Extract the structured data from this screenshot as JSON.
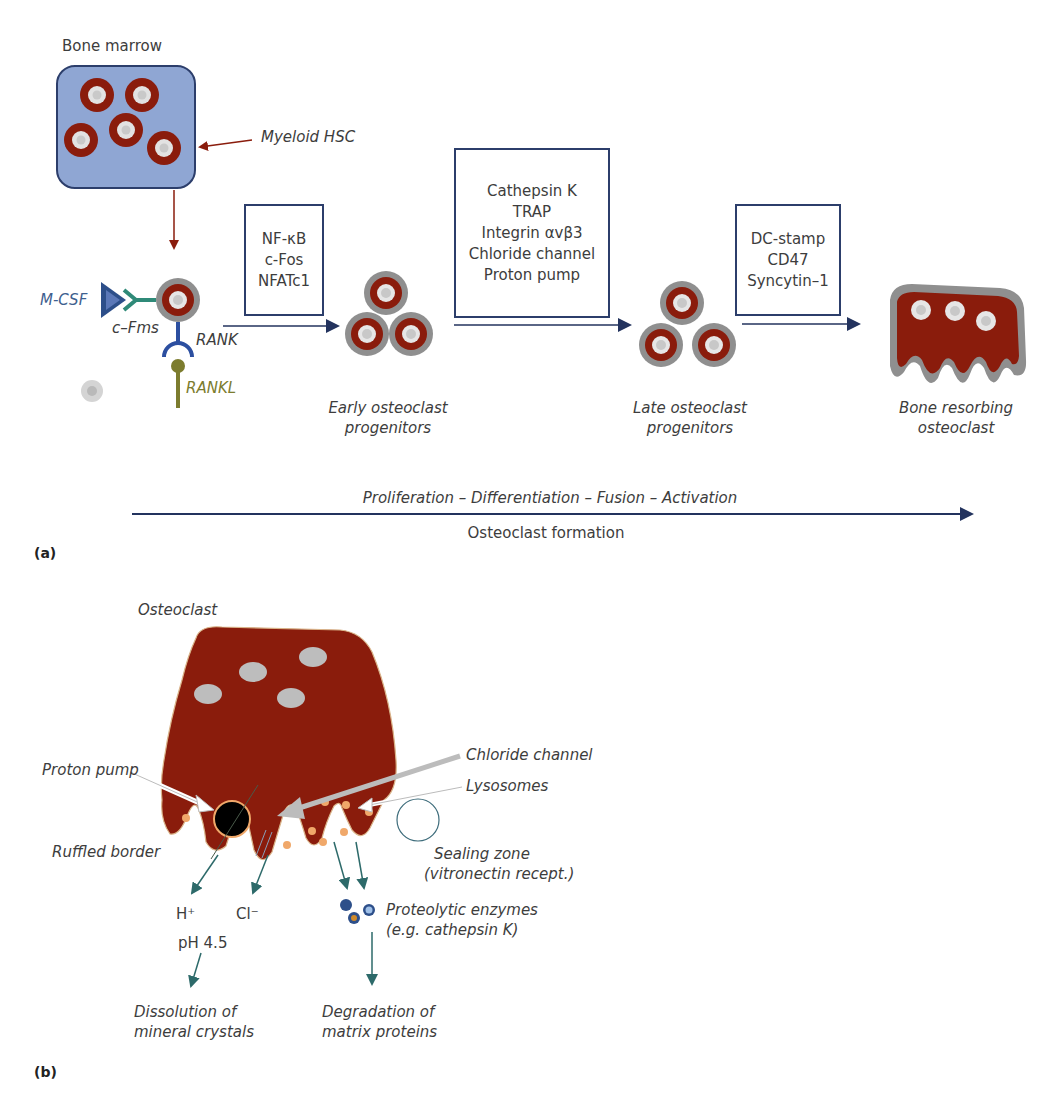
{
  "colors": {
    "marrow_fill": "#8fa6d3",
    "marrow_border": "#2c3e6b",
    "cell_red": "#8a1c0c",
    "cell_gray": "#8f8f8f",
    "nucleus": "#dcdcdc",
    "arrow_red": "#8a1c0c",
    "arrow_navy": "#23335e",
    "arrow_teal": "#2d6a6a",
    "mcsf": "#2d4f8a",
    "cfms": "#2f8a78",
    "rank": "#2c4fa0",
    "rankl": "#7c7c2e",
    "lysosome": "#f0a86a",
    "proton_pump": "#000000"
  },
  "panel_a": {
    "label": "(a)",
    "bone_marrow_title": "Bone marrow",
    "myeloid_hsc": "Myeloid HSC",
    "mcsf": "M-CSF",
    "cfms": "c–Fms",
    "rank": "RANK",
    "rankl": "RANKL",
    "box1": [
      "NF-κB",
      "c-Fos",
      "NFATc1"
    ],
    "box2": [
      "Cathepsin K",
      "TRAP",
      "Integrin αvβ3",
      "Chloride channel",
      "Proton pump"
    ],
    "box3": [
      "DC-stamp",
      "CD47",
      "Syncytin–1"
    ],
    "stage1": [
      "Early osteoclast",
      "progenitors"
    ],
    "stage2": [
      "Late osteoclast",
      "progenitors"
    ],
    "stage3": [
      "Bone resorbing",
      "osteoclast"
    ],
    "timeline_top": "Proliferation – Differentiation – Fusion – Activation",
    "timeline_bottom": "Osteoclast formation"
  },
  "panel_b": {
    "label": "(b)",
    "osteoclast": "Osteoclast",
    "proton_pump": "Proton pump",
    "chloride_channel": "Chloride channel",
    "lysosomes": "Lysosomes",
    "ruffled_border": "Ruffled border",
    "sealing_zone": [
      "Sealing zone",
      "(vitronectin recept.)"
    ],
    "h_plus": "H⁺",
    "cl_minus": "Cl⁻",
    "ph": "pH 4.5",
    "proteolytic": [
      "Proteolytic enzymes",
      "(e.g. cathepsin K)"
    ],
    "dissolution": [
      "Dissolution of",
      "mineral crystals"
    ],
    "degradation": [
      "Degradation of",
      "matrix proteins"
    ]
  }
}
